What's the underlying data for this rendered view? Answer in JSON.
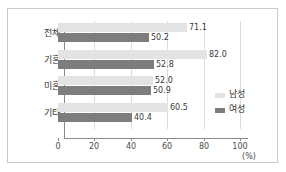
{
  "chart_data": {
    "type": "bar",
    "orientation": "horizontal",
    "title": "",
    "xlabel": "(%)",
    "ylabel": "",
    "xlim": [
      0,
      100
    ],
    "xticks": [
      "0",
      "20",
      "40",
      "60",
      "80",
      "100"
    ],
    "grid": true,
    "legend_position": "right",
    "categories": [
      "전체",
      "기혼",
      "미혼",
      "기타"
    ],
    "series": [
      {
        "name": "남성",
        "color": "#e3e3e3",
        "values": [
          71.1,
          82.0,
          52.0,
          60.5
        ],
        "labels": [
          "71.1",
          "82.0",
          "52.0",
          "60.5"
        ]
      },
      {
        "name": "여성",
        "color": "#7d7d7d",
        "values": [
          50.2,
          52.8,
          50.9,
          40.4
        ],
        "labels": [
          "50.2",
          "52.8",
          "50.9",
          "40.4"
        ]
      }
    ]
  },
  "axis": {
    "unit": "(%)",
    "ticks": [
      {
        "label": "0",
        "value": 0
      },
      {
        "label": "20",
        "value": 20
      },
      {
        "label": "40",
        "value": 40
      },
      {
        "label": "60",
        "value": 60
      },
      {
        "label": "80",
        "value": 80
      },
      {
        "label": "100",
        "value": 100
      }
    ]
  },
  "legend": {
    "items": [
      {
        "label": "남성",
        "color": "#e3e3e3"
      },
      {
        "label": "여성",
        "color": "#7d7d7d"
      }
    ]
  }
}
